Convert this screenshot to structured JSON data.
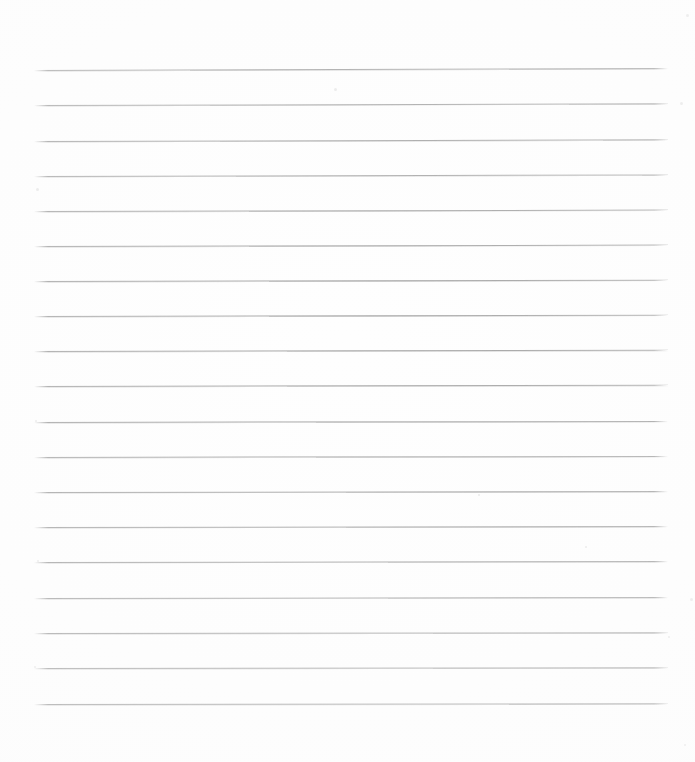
{
  "document": {
    "kind": "lined-paper-scan",
    "title": "Blank Ruled Notebook Page",
    "state": "blank",
    "visible_text": "",
    "page_width_px": 695,
    "page_height_px": 762,
    "background_color": "#fefefe",
    "paper_tone": "#fdfdfd"
  },
  "rules": {
    "count": 19,
    "color": "#9c9c9c",
    "thickness_px": 1,
    "style": "solid",
    "left_x_px": 34,
    "right_x_px": 668,
    "line_length_px": 634,
    "first_line_y_px": 70,
    "last_line_y_px": 704,
    "spacing_px": 35.2,
    "orientation": "horizontal",
    "tilt_deg": -0.12,
    "lines": [
      {
        "index": 1,
        "y_px": 70,
        "tilt_deg": -0.18,
        "opacity": 0.92
      },
      {
        "index": 2,
        "y_px": 105,
        "tilt_deg": -0.16,
        "opacity": 0.9
      },
      {
        "index": 3,
        "y_px": 141,
        "tilt_deg": -0.15,
        "opacity": 0.93
      },
      {
        "index": 4,
        "y_px": 176,
        "tilt_deg": -0.14,
        "opacity": 0.88
      },
      {
        "index": 5,
        "y_px": 211,
        "tilt_deg": -0.13,
        "opacity": 0.91
      },
      {
        "index": 6,
        "y_px": 246,
        "tilt_deg": -0.13,
        "opacity": 0.9
      },
      {
        "index": 7,
        "y_px": 281,
        "tilt_deg": -0.12,
        "opacity": 0.92
      },
      {
        "index": 8,
        "y_px": 316,
        "tilt_deg": -0.12,
        "opacity": 0.89
      },
      {
        "index": 9,
        "y_px": 351,
        "tilt_deg": -0.11,
        "opacity": 0.92
      },
      {
        "index": 10,
        "y_px": 386,
        "tilt_deg": -0.11,
        "opacity": 0.9
      },
      {
        "index": 11,
        "y_px": 422,
        "tilt_deg": -0.1,
        "opacity": 0.93
      },
      {
        "index": 12,
        "y_px": 457,
        "tilt_deg": -0.1,
        "opacity": 0.88
      },
      {
        "index": 13,
        "y_px": 492,
        "tilt_deg": -0.09,
        "opacity": 0.91
      },
      {
        "index": 14,
        "y_px": 527,
        "tilt_deg": -0.09,
        "opacity": 0.9
      },
      {
        "index": 15,
        "y_px": 562,
        "tilt_deg": -0.08,
        "opacity": 0.92
      },
      {
        "index": 16,
        "y_px": 598,
        "tilt_deg": -0.08,
        "opacity": 0.89
      },
      {
        "index": 17,
        "y_px": 633,
        "tilt_deg": -0.07,
        "opacity": 0.91
      },
      {
        "index": 18,
        "y_px": 668,
        "tilt_deg": -0.07,
        "opacity": 0.9
      },
      {
        "index": 19,
        "y_px": 704,
        "tilt_deg": -0.06,
        "opacity": 0.93
      }
    ]
  },
  "margins": {
    "top_px": 70,
    "bottom_px": 58,
    "left_px": 34,
    "right_px": 27,
    "header_area_label": "",
    "footer_area_label": ""
  },
  "writing_rows": {
    "count": 18,
    "content": [
      "",
      "",
      "",
      "",
      "",
      "",
      "",
      "",
      "",
      "",
      "",
      "",
      "",
      "",
      "",
      "",
      "",
      ""
    ]
  },
  "artifacts": {
    "description": "faint scanner speckles along the left and right margins",
    "color": "#e9e9e9",
    "specks": [
      {
        "x_px": 36,
        "y_px": 188,
        "size_px": 3
      },
      {
        "x_px": 35,
        "y_px": 420,
        "size_px": 2
      },
      {
        "x_px": 37,
        "y_px": 560,
        "size_px": 2
      },
      {
        "x_px": 34,
        "y_px": 666,
        "size_px": 2
      },
      {
        "x_px": 334,
        "y_px": 88,
        "size_px": 3
      },
      {
        "x_px": 478,
        "y_px": 494,
        "size_px": 2
      },
      {
        "x_px": 585,
        "y_px": 546,
        "size_px": 2
      },
      {
        "x_px": 680,
        "y_px": 102,
        "size_px": 3
      },
      {
        "x_px": 686,
        "y_px": 14,
        "size_px": 3
      },
      {
        "x_px": 690,
        "y_px": 598,
        "size_px": 3
      },
      {
        "x_px": 668,
        "y_px": 636,
        "size_px": 2
      },
      {
        "x_px": 684,
        "y_px": 744,
        "size_px": 2
      }
    ]
  }
}
